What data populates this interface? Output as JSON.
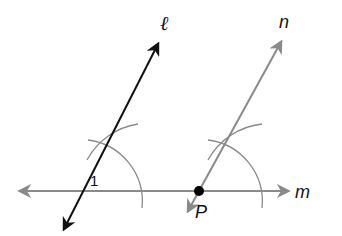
{
  "diagram": {
    "title": "",
    "colors": {
      "line_l": "#111111",
      "line_n": "#8a8a8a",
      "line_m": "#8a8a8a",
      "arcs": "#8a8a8a",
      "point": "#000000"
    },
    "labels": {
      "line_l": "ℓ",
      "line_n": "n",
      "line_m": "m",
      "point_P": "P",
      "angle_1": "1"
    },
    "geometry": {
      "line_m": {
        "x1": 17,
        "y1": 191,
        "x2": 290,
        "y2": 191
      },
      "line_l": {
        "x1": 62,
        "y1": 233,
        "x2": 160,
        "y2": 40
      },
      "line_n": {
        "x1": 186,
        "y1": 215,
        "x2": 283,
        "y2": 38
      },
      "point_P": {
        "x": 199,
        "y": 191
      },
      "intersection_l_m": {
        "x": 80,
        "y": 191
      },
      "arc_radius": 62
    }
  }
}
